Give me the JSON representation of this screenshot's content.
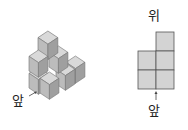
{
  "left_figure": {
    "description": "Isometric stack of unit cubes",
    "front_label": "앞",
    "colors": {
      "top": "#d6d6d6",
      "left": "#bdbdbd",
      "right": "#9e9e9e",
      "edge": "#7a7a7a"
    }
  },
  "right_figure": {
    "description": "Top view grid",
    "top_label": "위",
    "front_label": "앞",
    "grid": {
      "columns": 2,
      "rows": 3,
      "filled_cells": [
        [
          0,
          1
        ],
        [
          1,
          0
        ],
        [
          1,
          1
        ],
        [
          2,
          0
        ],
        [
          2,
          1
        ]
      ],
      "fill": "#d3d3d3",
      "stroke": "#555555"
    }
  }
}
